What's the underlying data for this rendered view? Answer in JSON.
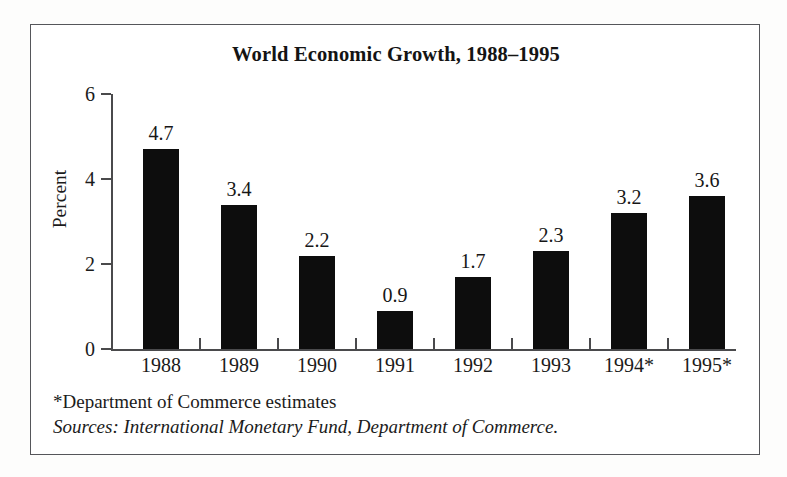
{
  "chart_data": {
    "type": "bar",
    "title": "World Economic Growth, 1988–1995",
    "xlabel": "",
    "ylabel": "Percent",
    "categories": [
      "1988",
      "1989",
      "1990",
      "1991",
      "1992",
      "1993",
      "1994*",
      "1995*"
    ],
    "values": [
      4.7,
      3.4,
      2.2,
      0.9,
      1.7,
      2.3,
      3.2,
      3.6
    ],
    "value_labels": [
      "4.7",
      "3.4",
      "2.2",
      "0.9",
      "1.7",
      "2.3",
      "3.2",
      "3.6"
    ],
    "ylim": [
      0,
      6
    ],
    "yticks": [
      0,
      2,
      4,
      6
    ],
    "ytick_labels": [
      "0",
      "2",
      "4",
      "6"
    ],
    "grid": false,
    "legend": null,
    "bar_color": "#0d0d0d",
    "axis_color": "#4a4a4c",
    "annotations": [
      "*Department of Commerce estimates",
      "Sources: International Monetary Fund, Department of Commerce."
    ]
  },
  "figure": {
    "title": "World Economic Growth, 1988–1995",
    "y_axis_title": "Percent",
    "footnote_estimates": "*Department of Commerce estimates",
    "footnote_sources": "Sources: International Monetary Fund, Department of Commerce."
  }
}
